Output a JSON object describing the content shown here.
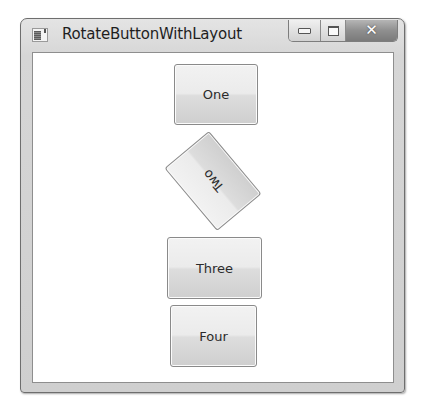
{
  "window": {
    "title": "RotateButtonWithLayout",
    "icon": "app-window-icon",
    "caption_buttons": [
      {
        "name": "minimize",
        "icon": "minimize-icon"
      },
      {
        "name": "maximize",
        "icon": "maximize-icon"
      },
      {
        "name": "close",
        "icon": "close-icon",
        "glyph": "✕"
      }
    ]
  },
  "content": {
    "buttons": [
      {
        "label": "One",
        "rotation_deg": 0
      },
      {
        "label": "Two",
        "rotation_deg": 230
      },
      {
        "label": "Three",
        "rotation_deg": 0
      },
      {
        "label": "Four",
        "rotation_deg": 0
      }
    ]
  }
}
